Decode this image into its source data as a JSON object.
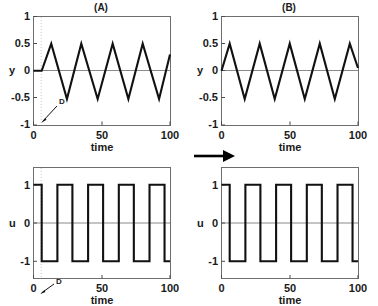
{
  "figure": {
    "background": "#ffffff",
    "line_color": "#111111",
    "axis_color": "#6e6e6e",
    "grid_color": "#c8c8c8",
    "transition_arrow": "→"
  },
  "chart_data": [
    {
      "id": "panel-a",
      "type": "line",
      "title": "(A)",
      "xlabel": "time",
      "ylabel": "y",
      "xlim": [
        0,
        100
      ],
      "ylim": [
        -1,
        1
      ],
      "xticks": [
        0,
        50,
        100
      ],
      "xticklabels": [
        "0",
        "50",
        "100"
      ],
      "yticks": [
        -1,
        -0.5,
        0,
        0.5,
        1
      ],
      "yticklabels": [
        "-1",
        "-0.5",
        "0",
        "0.5",
        "1"
      ],
      "grid": false,
      "legend": "none",
      "annotations": [
        {
          "label": "D",
          "x": 6,
          "note": "delay marker, dotted vertical line at t=6"
        }
      ],
      "series": [
        {
          "name": "y",
          "comment": "zero until delay D=6, then triangular wave amplitude 0.5, period 22.5",
          "x": [
            0,
            6,
            13,
            24.5,
            35,
            47,
            58,
            69.5,
            80,
            92,
            100
          ],
          "y": [
            0,
            0,
            0.5,
            -0.52,
            0.5,
            -0.52,
            0.5,
            -0.52,
            0.5,
            -0.52,
            0.3
          ]
        }
      ]
    },
    {
      "id": "panel-b",
      "type": "line",
      "title": "(B)",
      "xlabel": "time",
      "ylabel": "y",
      "xlim": [
        0,
        100
      ],
      "ylim": [
        -1,
        1
      ],
      "xticks": [
        0,
        50,
        100
      ],
      "xticklabels": [
        "0",
        "50",
        "100"
      ],
      "yticks": [
        -1,
        -0.5,
        0,
        0.5,
        1
      ],
      "yticklabels": [
        "-1",
        "-0.5",
        "0",
        "0.5",
        "1"
      ],
      "grid": false,
      "legend": "none",
      "annotations": [],
      "series": [
        {
          "name": "y",
          "comment": "triangular wave starting at t=0, amplitude 0.5, period 22",
          "x": [
            0,
            6,
            17,
            28,
            39,
            50,
            61,
            72,
            83,
            94,
            100
          ],
          "y": [
            0,
            0.5,
            -0.52,
            0.5,
            -0.52,
            0.5,
            -0.52,
            0.5,
            -0.52,
            0.5,
            0.05
          ]
        }
      ]
    },
    {
      "id": "panel-c",
      "type": "line",
      "title": "",
      "xlabel": "time",
      "ylabel": "u",
      "xlim": [
        0,
        100
      ],
      "ylim": [
        -1.45,
        1.45
      ],
      "xticks": [
        0,
        50,
        100
      ],
      "xticklabels": [
        "0",
        "50",
        "100"
      ],
      "yticks": [
        -1,
        0,
        1
      ],
      "yticklabels": [
        "-1",
        "0",
        "1"
      ],
      "grid": false,
      "legend": "none",
      "annotations": [
        {
          "label": "D",
          "x": 6,
          "note": "delay marker, dotted vertical line at t=6"
        }
      ],
      "series": [
        {
          "name": "u",
          "comment": "square wave +-1, first switch at t=6, half-period 11.25",
          "x": [
            0,
            6,
            6,
            17.5,
            17.5,
            28.5,
            28.5,
            40,
            40,
            51,
            51,
            62.5,
            62.5,
            73.5,
            73.5,
            85,
            85,
            96,
            96,
            100
          ],
          "y": [
            1,
            1,
            -1,
            -1,
            1,
            1,
            -1,
            -1,
            1,
            1,
            -1,
            -1,
            1,
            1,
            -1,
            -1,
            1,
            1,
            -1,
            -1
          ]
        }
      ]
    },
    {
      "id": "panel-d",
      "type": "line",
      "title": "",
      "xlabel": "time",
      "ylabel": "u",
      "xlim": [
        0,
        100
      ],
      "ylim": [
        -1.45,
        1.45
      ],
      "xticks": [
        0,
        50,
        100
      ],
      "xticklabels": [
        "0",
        "50",
        "100"
      ],
      "yticks": [
        -1,
        0,
        1
      ],
      "yticklabels": [
        "-1",
        "0",
        "1"
      ],
      "grid": false,
      "legend": "none",
      "annotations": [],
      "series": [
        {
          "name": "u",
          "comment": "square wave +-1, first switch at t=6, half-period 11.25",
          "x": [
            0,
            6,
            6,
            17.5,
            17.5,
            28.5,
            28.5,
            40,
            40,
            51,
            51,
            62.5,
            62.5,
            73.5,
            73.5,
            85,
            85,
            96,
            96,
            100
          ],
          "y": [
            1,
            1,
            -1,
            -1,
            1,
            1,
            -1,
            -1,
            1,
            1,
            -1,
            -1,
            1,
            1,
            -1,
            -1,
            1,
            1,
            -1,
            -1
          ]
        }
      ]
    }
  ]
}
